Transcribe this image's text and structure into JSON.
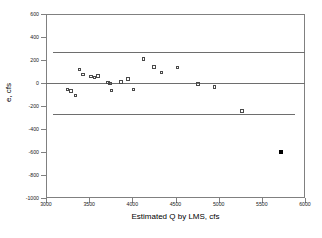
{
  "chart_data": {
    "type": "scatter",
    "title": "",
    "xlabel": "Estimated Q by LMS, cfs",
    "ylabel": "e, cfs",
    "xlim": [
      3000,
      6000
    ],
    "ylim": [
      -1000,
      600
    ],
    "xticks": [
      3000,
      3500,
      4000,
      4500,
      5000,
      5500,
      6000
    ],
    "yticks": [
      600,
      400,
      200,
      0,
      -200,
      -400,
      -600,
      -800,
      -1000
    ],
    "xtick_labels": [
      "3000",
      "3500",
      "4000",
      "4500",
      "5000",
      "5500",
      "6000"
    ],
    "ytick_labels": [
      "600",
      "400",
      "200",
      "0",
      "-200",
      "-400",
      "-600",
      "-800",
      "-1000"
    ],
    "grid": false,
    "legend": null,
    "reference_lines": [
      {
        "name": "upper-limit-line",
        "y": 270,
        "x_start": 3080,
        "x_end": 6000
      },
      {
        "name": "zero-line",
        "y": 0,
        "x_start": 3000,
        "x_end": 6000
      },
      {
        "name": "lower-limit-line",
        "y": -270,
        "x_start": 3080,
        "x_end": 5880
      }
    ],
    "series": [
      {
        "name": "residuals",
        "marker": "open-square",
        "color": "#4a4a4a",
        "points": [
          {
            "x": 3250,
            "y": -55
          },
          {
            "x": 3290,
            "y": -70
          },
          {
            "x": 3340,
            "y": -110
          },
          {
            "x": 3390,
            "y": 120
          },
          {
            "x": 3430,
            "y": 75
          },
          {
            "x": 3520,
            "y": 55
          },
          {
            "x": 3560,
            "y": 50
          },
          {
            "x": 3600,
            "y": 62
          },
          {
            "x": 3720,
            "y": 5
          },
          {
            "x": 3740,
            "y": -5
          },
          {
            "x": 3760,
            "y": -65
          },
          {
            "x": 3870,
            "y": 10
          },
          {
            "x": 3950,
            "y": 35
          },
          {
            "x": 4010,
            "y": -55
          },
          {
            "x": 4130,
            "y": 210
          },
          {
            "x": 4250,
            "y": 140
          },
          {
            "x": 4340,
            "y": 90
          },
          {
            "x": 4520,
            "y": 135
          },
          {
            "x": 4760,
            "y": -10
          },
          {
            "x": 4950,
            "y": -35
          },
          {
            "x": 5270,
            "y": -245
          }
        ]
      },
      {
        "name": "outlier",
        "marker": "filled-square",
        "color": "#000000",
        "points": [
          {
            "x": 5720,
            "y": -600
          }
        ]
      }
    ]
  }
}
